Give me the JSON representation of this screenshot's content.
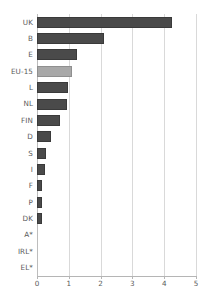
{
  "chart_data": {
    "type": "bar",
    "orientation": "horizontal",
    "title": "",
    "subtitle": "",
    "xlabel": "",
    "ylabel": "",
    "xlim": [
      0,
      5
    ],
    "xticks": [
      "0",
      "1",
      "2",
      "3",
      "4",
      "5"
    ],
    "grid": true,
    "legend": "none",
    "categories": [
      "UK",
      "B",
      "E",
      "EU-15",
      "L",
      "NL",
      "FIN",
      "D",
      "S",
      "I",
      "F",
      "P",
      "DK",
      "A*",
      "IRL*",
      "EL*"
    ],
    "values": [
      4.23,
      2.12,
      1.25,
      1.1,
      0.97,
      0.95,
      0.72,
      0.45,
      0.27,
      0.25,
      0.16,
      0.17,
      0.15,
      0,
      0,
      0
    ],
    "bar_colors": [
      "#4a4a4a",
      "#4a4a4a",
      "#4a4a4a",
      "#a8a8a8",
      "#4a4a4a",
      "#4a4a4a",
      "#4a4a4a",
      "#4a4a4a",
      "#4a4a4a",
      "#4a4a4a",
      "#4a4a4a",
      "#4a4a4a",
      "#4a4a4a",
      "#4a4a4a",
      "#4a4a4a",
      "#4a4a4a"
    ],
    "highlight_category": "EU-15",
    "colors": {
      "bar": "#4a4a4a",
      "bar_highlight": "#a8a8a8",
      "gridline": "#d9d9d9",
      "axis": "#b5b5b5",
      "text": "#5a5a5a",
      "background": "#ffffff"
    }
  }
}
